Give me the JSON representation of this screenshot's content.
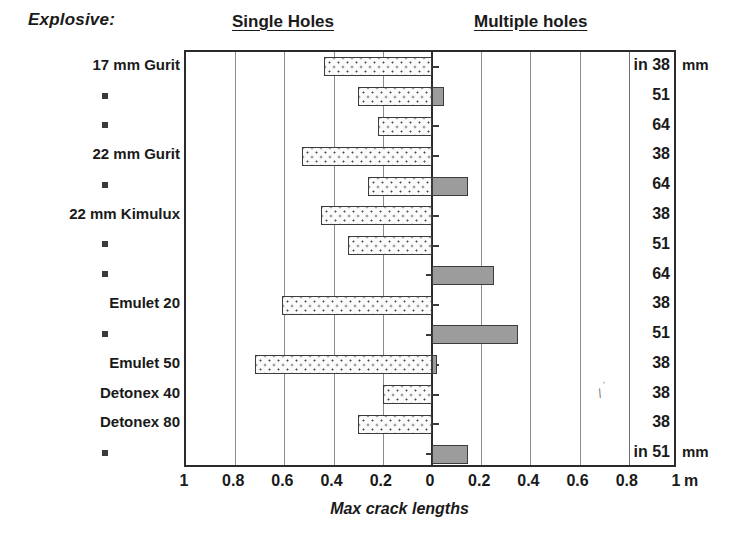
{
  "header": {
    "explosive_label": "Explosive:",
    "left_panel_title": "Single Holes",
    "right_panel_title": "Multiple holes"
  },
  "axis": {
    "title": "Max crack lengths",
    "unit_right": "m",
    "tick_labels": [
      "1",
      "0.8",
      "0.6",
      "0.4",
      "0.2",
      "0",
      "0.2",
      "0.4",
      "0.6",
      "0.8",
      "1"
    ],
    "unit_header_top": "mm",
    "unit_header_bottom": "mm",
    "in_prefix_top": "in",
    "in_prefix_bottom": "in"
  },
  "chart_data": {
    "type": "bar",
    "xlabel": "Max crack lengths",
    "ylabel": "Explosive:",
    "orientation": "horizontal",
    "diverging": true,
    "xlim": [
      -1,
      1
    ],
    "xticks": [
      -1,
      -0.8,
      -0.6,
      -0.4,
      -0.2,
      0,
      0.2,
      0.4,
      0.6,
      0.8,
      1
    ],
    "xtick_labels": [
      "1",
      "0.8",
      "0.6",
      "0.4",
      "0.2",
      "0",
      "0.2",
      "0.4",
      "0.6",
      "0.8",
      "1"
    ],
    "x_unit": "m",
    "grid": true,
    "legend": [
      "Single Holes",
      "Multiple holes"
    ],
    "legend_position": "top",
    "categories": [
      "17 mm Gurit",
      "▪",
      "▪",
      "22 mm Gurit",
      "▪",
      "22 mm Kimulux",
      "▪",
      "▪",
      "Emulet 20",
      "▪",
      "Emulet 50",
      "Detonex 40",
      "Detonex 80",
      "▪"
    ],
    "hole_diameters_mm": [
      38,
      51,
      64,
      38,
      64,
      38,
      51,
      64,
      38,
      51,
      38,
      38,
      38,
      51
    ],
    "series": [
      {
        "name": "Single Holes",
        "direction": "left",
        "values": [
          0.44,
          0.3,
          0.22,
          0.53,
          0.26,
          0.45,
          0.34,
          0.0,
          0.61,
          0.0,
          0.72,
          0.2,
          0.3,
          0.0
        ]
      },
      {
        "name": "Multiple holes",
        "direction": "right",
        "values": [
          0.0,
          0.05,
          0.0,
          0.0,
          0.145,
          0.0,
          0.0,
          0.25,
          0.0,
          0.35,
          0.02,
          0.0,
          0.0,
          0.145
        ]
      }
    ]
  },
  "rows": [
    {
      "label": "17 mm Gurit",
      "mm": "38",
      "in": "in",
      "unit": "mm"
    },
    {
      "label": "▪",
      "mm": "51",
      "in": "",
      "unit": ""
    },
    {
      "label": "▪",
      "mm": "64",
      "in": "",
      "unit": ""
    },
    {
      "label": "22 mm Gurit",
      "mm": "38",
      "in": "",
      "unit": ""
    },
    {
      "label": "▪",
      "mm": "64",
      "in": "",
      "unit": ""
    },
    {
      "label": "22 mm Kimulux",
      "mm": "38",
      "in": "",
      "unit": ""
    },
    {
      "label": "▪",
      "mm": "51",
      "in": "",
      "unit": ""
    },
    {
      "label": "▪",
      "mm": "64",
      "in": "",
      "unit": ""
    },
    {
      "label": "Emulet 20",
      "mm": "38",
      "in": "",
      "unit": ""
    },
    {
      "label": "▪",
      "mm": "51",
      "in": "",
      "unit": ""
    },
    {
      "label": "Emulet 50",
      "mm": "38",
      "in": "",
      "unit": ""
    },
    {
      "label": "Detonex 40",
      "mm": "38",
      "in": "",
      "unit": ""
    },
    {
      "label": "Detonex 80",
      "mm": "38",
      "in": "",
      "unit": ""
    },
    {
      "label": "▪",
      "mm": "51",
      "in": "in",
      "unit": "mm"
    }
  ],
  "colors": {
    "single_fill": "#fbfbfb",
    "multiple_fill": "#9c9c9c",
    "bar_border": "#3c3c3c",
    "axis": "#2b2b2b",
    "gridline": "#8c8c8c",
    "text": "#1a1a1a"
  }
}
